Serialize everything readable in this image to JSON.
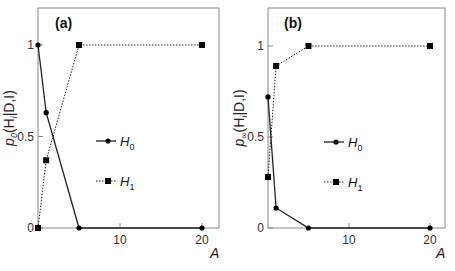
{
  "chart_data": [
    {
      "type": "line",
      "panel_label": "(a)",
      "ylabel": "p_0(H_i|D,I)",
      "ylabel_main": "p",
      "ylabel_sub": "0",
      "ylabel_rest": "(H",
      "ylabel_i": "i",
      "ylabel_tail": "|D,I)",
      "xlabel": "A",
      "x_ticks": [
        "10",
        "20"
      ],
      "y_ticks": [
        "0",
        "0.5",
        "1"
      ],
      "xlim": [
        0,
        22
      ],
      "ylim": [
        0,
        1.2
      ],
      "grid": false,
      "legend_position": "center",
      "series": [
        {
          "name": "H0",
          "label": "H",
          "sub": "0",
          "line_style": "solid",
          "marker": "circle",
          "x": [
            0,
            1,
            5,
            20
          ],
          "y": [
            1.0,
            0.63,
            0.0,
            0.0
          ]
        },
        {
          "name": "H1",
          "label": "H",
          "sub": "1",
          "line_style": "dotted",
          "marker": "square",
          "x": [
            0,
            1,
            5,
            20
          ],
          "y": [
            0.0,
            0.37,
            1.0,
            1.0
          ]
        }
      ]
    },
    {
      "type": "line",
      "panel_label": "(b)",
      "ylabel": "p_∞(H_i|D,I)",
      "ylabel_main": "p",
      "ylabel_sub": "∞",
      "ylabel_rest": "(H",
      "ylabel_i": "i",
      "ylabel_tail": "|D,I)",
      "xlabel": "A",
      "x_ticks": [
        "10",
        "20"
      ],
      "y_ticks": [
        "0",
        "0.5",
        "1"
      ],
      "xlim": [
        0,
        22
      ],
      "ylim": [
        0,
        1.2
      ],
      "grid": false,
      "legend_position": "center",
      "series": [
        {
          "name": "H0",
          "label": "H",
          "sub": "0",
          "line_style": "solid",
          "marker": "circle",
          "x": [
            0,
            1,
            5,
            20
          ],
          "y": [
            0.72,
            0.11,
            0.0,
            0.0
          ]
        },
        {
          "name": "H1",
          "label": "H",
          "sub": "1",
          "line_style": "dotted",
          "marker": "square",
          "x": [
            0,
            1,
            5,
            20
          ],
          "y": [
            0.28,
            0.89,
            1.0,
            1.0
          ]
        }
      ]
    }
  ]
}
